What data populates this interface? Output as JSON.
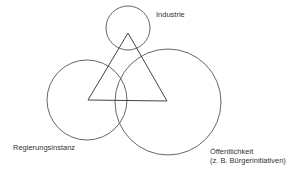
{
  "diagram": {
    "stroke_color": "#555555",
    "background": "#ffffff",
    "nodes": [
      {
        "id": "industrie",
        "label": "Industrie",
        "circle": {
          "cx": 128,
          "cy": 28,
          "r": 22
        }
      },
      {
        "id": "regierungsinstanz",
        "label": "Regierungsinstanz",
        "circle": {
          "cx": 87,
          "cy": 100,
          "r": 40
        }
      },
      {
        "id": "oeffentlichkeit",
        "label": "Öffentlichkeit",
        "sublabel": "(z. B. Bürgerinitiativen)",
        "circle": {
          "cx": 168,
          "cy": 102,
          "r": 53
        }
      }
    ],
    "triangle": {
      "points": [
        [
          128,
          33
        ],
        [
          88,
          100
        ],
        [
          167,
          101
        ]
      ]
    }
  },
  "labels": {
    "industrie": "Industrie",
    "regierungsinstanz": "Regierungsinstanz",
    "oeffentlichkeit_line1": "Öffentlichkeit",
    "oeffentlichkeit_line2": "(z. B. Bürgerinitiativen)"
  }
}
